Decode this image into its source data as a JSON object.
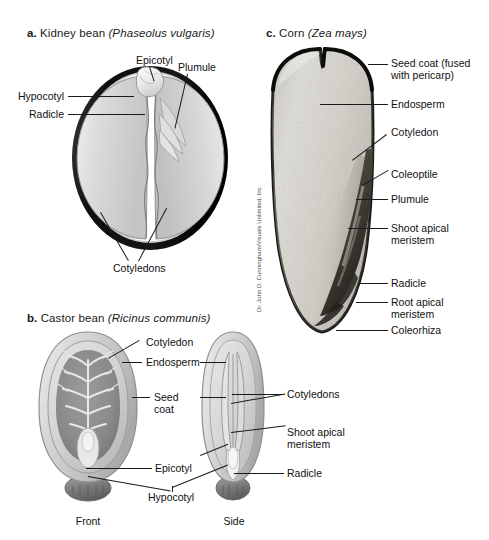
{
  "figure": {
    "background": "#ffffff",
    "width": 489,
    "height": 540
  },
  "panels": {
    "a": {
      "letter": "a.",
      "name": "Kidney bean",
      "scientific_name": "(Phaseolus vulgaris)",
      "labels": {
        "epicotyl": "Epicotyl",
        "plumule": "Plumule",
        "hypocotyl": "Hypocotyl",
        "radicle": "Radicle",
        "cotyledons": "Cotyledons"
      }
    },
    "b": {
      "letter": "b.",
      "name": "Castor bean",
      "scientific_name": "(Ricinus communis)",
      "labels": {
        "cotyledon": "Cotyledon",
        "endosperm": "Endosperm",
        "seed_coat": "Seed\ncoat",
        "seed_coat_line1": "Seed",
        "seed_coat_line2": "coat",
        "cotyledons": "Cotyledons",
        "shoot_apical_meristem_line1": "Shoot apical",
        "shoot_apical_meristem_line2": "meristem",
        "radicle": "Radicle",
        "epicotyl": "Epicotyl",
        "hypocotyl": "Hypocotyl",
        "view_front": "Front",
        "view_side": "Side"
      }
    },
    "c": {
      "letter": "c.",
      "name": "Corn",
      "scientific_name": "(Zea mays)",
      "credit": "Dr. John D. Cunningham/Visuals Unlimited, Inc.",
      "labels": {
        "seed_coat_line1": "Seed coat (fused",
        "seed_coat_line2": "with pericarp)",
        "endosperm": "Endosperm",
        "cotyledon": "Cotyledon",
        "coleoptile": "Coleoptile",
        "plumule": "Plumule",
        "shoot_apical_meristem_line1": "Shoot apical",
        "shoot_apical_meristem_line2": "meristem",
        "radicle": "Radicle",
        "root_apical_meristem_line1": "Root apical",
        "root_apical_meristem_line2": "meristem",
        "coleorhiza": "Coleorhiza"
      }
    }
  },
  "colors": {
    "text": "#1a1a1a",
    "leader_line": "#1a1a1a",
    "seed_coat_dark": "#171717",
    "cotyledon_fill": "#d2d2d2",
    "cotyledon_fill_light": "#e2e2e2",
    "castor_outer": "#c9c9c9",
    "castor_inner": "#9a9a9a",
    "castor_endosperm": "#d8d8d8",
    "caruncle": "#8a8a8a",
    "corn_endosperm": "#d9d7d2",
    "corn_embryo": "#5a564f",
    "corn_coat": "#2a2723"
  }
}
